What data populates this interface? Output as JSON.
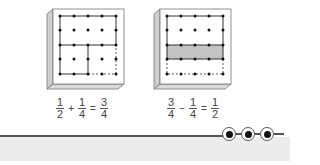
{
  "figures": [
    {
      "id": "board-1",
      "description": "Geoboard showing 1/2 + 1/4",
      "equation": {
        "a_num": "1",
        "a_den": "2",
        "op": "+",
        "b_num": "1",
        "b_den": "4",
        "eq": "=",
        "r_num": "3",
        "r_den": "4"
      }
    },
    {
      "id": "board-2",
      "description": "Geoboard showing 3/4 - 1/4",
      "equation": {
        "a_num": "3",
        "a_den": "4",
        "op": "−",
        "b_num": "1",
        "b_den": "4",
        "eq": "=",
        "r_num": "1",
        "r_den": "2"
      }
    }
  ],
  "colors": {
    "shade": "#c4c4c4",
    "board_side": "#cfcfcf",
    "band": "#ececec",
    "rule": "#555555"
  },
  "footer": {
    "nav_dots": [
      "dot-1",
      "dot-2",
      "dot-3"
    ]
  }
}
